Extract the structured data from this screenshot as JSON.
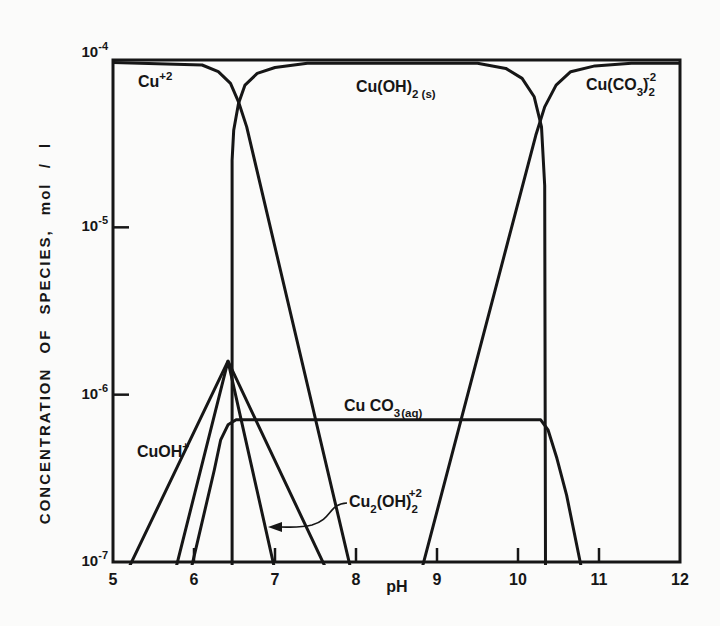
{
  "meta": {
    "background_color": "#fbfbfa",
    "ink_color": "#161616"
  },
  "chart_data": {
    "type": "line",
    "title": "",
    "xlabel": "pH",
    "ylabel": "CONCENTRATION OF SPECIES, mol / l",
    "x_axis": {
      "min": 5,
      "max": 12,
      "scale": "linear",
      "ticks": [
        {
          "label": "5",
          "v": 5,
          "has_tick": false
        },
        {
          "label": "6",
          "v": 6,
          "has_tick": true
        },
        {
          "label": "7",
          "v": 7,
          "has_tick": true
        },
        {
          "label": "8",
          "v": 8,
          "has_tick": true
        },
        {
          "label": "9",
          "v": 9,
          "has_tick": true
        },
        {
          "label": "10",
          "v": 10,
          "has_tick": true
        },
        {
          "label": "11",
          "v": 11,
          "has_tick": true
        },
        {
          "label": "12",
          "v": 12,
          "has_tick": false
        }
      ]
    },
    "y_axis": {
      "scale": "log",
      "log_max": -4,
      "log_min": -7,
      "ticks": [
        {
          "main": "10",
          "exp": "-4",
          "log": -4,
          "has_tick": false
        },
        {
          "main": "10",
          "exp": "-5",
          "log": -5,
          "has_tick": true
        },
        {
          "main": "10",
          "exp": "-6",
          "log": -6,
          "has_tick": true
        },
        {
          "main": "10",
          "exp": "-7",
          "log": -7,
          "has_tick": false
        }
      ]
    },
    "grid": false,
    "legend": "none (curves labeled in-plot)",
    "series": [
      {
        "id": "cu2plus",
        "name": "Cu+2",
        "points": [
          [
            5.0,
            -4.015
          ],
          [
            6.1,
            -4.03
          ],
          [
            6.3,
            -4.07
          ],
          [
            6.45,
            -4.14
          ],
          [
            6.55,
            -4.25
          ],
          [
            6.65,
            -4.4
          ],
          [
            7.93,
            -7.03
          ]
        ]
      },
      {
        "id": "cuoh2s",
        "name": "Cu(OH)2(s)",
        "points": [
          [
            6.47,
            -7.03
          ],
          [
            6.47,
            -4.6
          ],
          [
            6.49,
            -4.42
          ],
          [
            6.55,
            -4.26
          ],
          [
            6.63,
            -4.15
          ],
          [
            6.78,
            -4.08
          ],
          [
            7.0,
            -4.045
          ],
          [
            7.4,
            -4.02
          ],
          [
            9.5,
            -4.02
          ],
          [
            9.85,
            -4.05
          ],
          [
            10.05,
            -4.11
          ],
          [
            10.2,
            -4.22
          ],
          [
            10.29,
            -4.4
          ],
          [
            10.33,
            -4.75
          ],
          [
            10.34,
            -7.03
          ]
        ]
      },
      {
        "id": "cuco32",
        "name": "Cu(CO3)2-2",
        "points": [
          [
            8.82,
            -7.03
          ],
          [
            10.22,
            -4.45
          ],
          [
            10.33,
            -4.28
          ],
          [
            10.47,
            -4.15
          ],
          [
            10.65,
            -4.07
          ],
          [
            10.95,
            -4.035
          ],
          [
            11.4,
            -4.02
          ],
          [
            12.0,
            -4.02
          ]
        ]
      },
      {
        "id": "cuco3aq",
        "name": "CuCO3(aq)",
        "points": [
          [
            5.97,
            -7.03
          ],
          [
            6.25,
            -6.45
          ],
          [
            6.33,
            -6.27
          ],
          [
            6.42,
            -6.18
          ],
          [
            6.52,
            -6.15
          ],
          [
            10.28,
            -6.15
          ],
          [
            10.37,
            -6.21
          ],
          [
            10.48,
            -6.38
          ],
          [
            10.6,
            -6.6
          ],
          [
            10.78,
            -7.03
          ]
        ]
      },
      {
        "id": "cuohplus",
        "name": "CuOH+",
        "points": [
          [
            5.2,
            -7.03
          ],
          [
            6.42,
            -5.8
          ],
          [
            7.62,
            -7.03
          ]
        ]
      },
      {
        "id": "cu2oh2",
        "name": "Cu2(OH)2+2",
        "points": [
          [
            5.78,
            -7.03
          ],
          [
            6.42,
            -5.8
          ],
          [
            6.99,
            -7.03
          ]
        ]
      }
    ],
    "labels": {
      "cu2plus": {
        "main": "Cu",
        "sup": "+2"
      },
      "cuoh2s": {
        "main": "Cu(OH)",
        "sub": "2 (s)"
      },
      "cuco32": {
        "p1": "Cu(CO",
        "sub1": "3",
        "p2": ")",
        "sub2": "2",
        "sup": "-2"
      },
      "cuco3aq": {
        "main": "Cu CO",
        "sub": "3",
        "state": "(aq)"
      },
      "cuohplus": {
        "main": "CuOH",
        "sup": "+"
      },
      "cu2oh2": {
        "p1": "Cu",
        "sub1": "2",
        "p2": "(OH)",
        "sub2": "2",
        "sup": "+2"
      }
    },
    "annotations": [
      {
        "type": "arrow",
        "from_label": "Cu2(OH)2+2",
        "points_to": "descending Cu2(OH)2+2 line near pH 6.9"
      }
    ]
  }
}
